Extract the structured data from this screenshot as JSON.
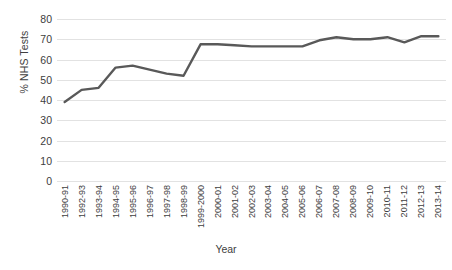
{
  "chart_data": {
    "type": "line",
    "title": "",
    "xlabel": "Year",
    "ylabel": "% NHS Tests",
    "ylim": [
      0,
      80
    ],
    "ytick_step": 10,
    "yticks": [
      80,
      70,
      60,
      50,
      40,
      30,
      20,
      10,
      0
    ],
    "grid": true,
    "legend": null,
    "line_color": "#595959",
    "categories": [
      "1990-91",
      "1992-93",
      "1993-94",
      "1994-95",
      "1995-96",
      "1996-97",
      "1997-98",
      "1998-99",
      "1999-2000",
      "2000-01",
      "2001-02",
      "2002-03",
      "2003-04",
      "2004-05",
      "2005-06",
      "2006-07",
      "2007-08",
      "2008-09",
      "2009-10",
      "2010-11",
      "2011-12",
      "2012-13",
      "2013-14"
    ],
    "values": [
      39,
      45,
      46,
      56,
      57,
      55,
      53,
      52,
      67.5,
      67.5,
      67,
      66.5,
      66.5,
      66.5,
      66.5,
      69.5,
      71,
      70,
      70,
      71,
      68.5,
      71.5,
      71.5
    ]
  }
}
